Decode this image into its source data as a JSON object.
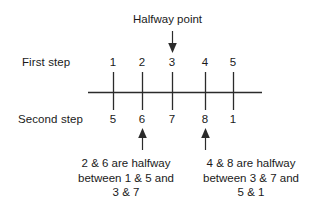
{
  "figure": {
    "background_color": "#ffffff",
    "stroke_color": "#2b2b2b",
    "text_color": "#1a1a1a",
    "callout": {
      "text": "Halfway point",
      "points_to": "3"
    },
    "rows": [
      {
        "name": "first-step",
        "label": "First step",
        "values": [
          "1",
          "2",
          "3",
          "4",
          "5"
        ]
      },
      {
        "name": "second-step",
        "label": "Second step",
        "values": [
          "5",
          "6",
          "7",
          "8",
          "1"
        ]
      }
    ],
    "captions": [
      {
        "name": "left-caption",
        "points_to": "6",
        "lines": [
          "2 & 6 are halfway",
          "between 1 & 5 and",
          "3 & 7"
        ]
      },
      {
        "name": "right-caption",
        "points_to": "8",
        "lines": [
          "4 & 8 are halfway",
          "between  3 & 7 and",
          "5 & 1"
        ]
      }
    ]
  }
}
